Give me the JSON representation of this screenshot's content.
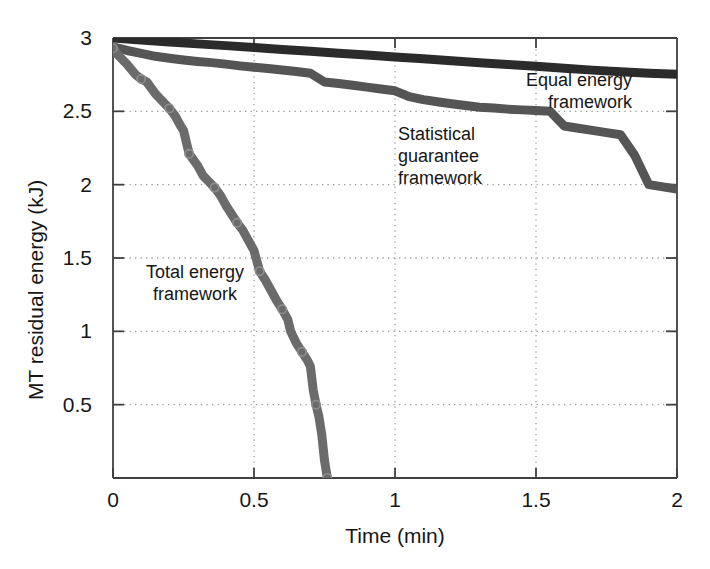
{
  "figure": {
    "background_color": "#ffffff",
    "axis_color": "#404040",
    "grid_color": "#9a9a9a"
  },
  "chart_data": {
    "type": "line",
    "title": "",
    "xlabel": "Time (min)",
    "ylabel": "MT residual energy (kJ)",
    "xlim": [
      0,
      2
    ],
    "ylim": [
      0,
      3
    ],
    "xticks": [
      0,
      0.5,
      1,
      1.5,
      2
    ],
    "xticklabels": [
      "0",
      "0.5",
      "1",
      "1.5",
      "2"
    ],
    "yticks": [
      0,
      0.5,
      1,
      1.5,
      2,
      2.5,
      3
    ],
    "yticklabels": [
      "",
      "0.5",
      "1",
      "1.5",
      "2",
      "2.5",
      "3"
    ],
    "grid": true,
    "grid_style": "dotted",
    "legend": "inline-annotations",
    "series": [
      {
        "name": "Equal energy framework",
        "label": "Equal energy\nframework",
        "color": "#2b2b2b",
        "line_width": 9,
        "markers": false,
        "x": [
          0,
          0.1,
          0.2,
          0.3,
          0.4,
          0.5,
          0.6,
          0.7,
          0.8,
          0.9,
          1.0,
          1.1,
          1.2,
          1.3,
          1.4,
          1.5,
          1.6,
          1.7,
          1.8,
          1.9,
          2.0
        ],
        "y": [
          3.0,
          2.986,
          2.973,
          2.96,
          2.948,
          2.935,
          2.922,
          2.909,
          2.896,
          2.884,
          2.871,
          2.858,
          2.845,
          2.832,
          2.82,
          2.807,
          2.794,
          2.781,
          2.77,
          2.76,
          2.752
        ]
      },
      {
        "name": "Statistical guarantee framework",
        "label": "Statistical\nguarantee\nframework",
        "color": "#555555",
        "line_width": 9,
        "markers": false,
        "x": [
          0,
          0.05,
          0.1,
          0.15,
          0.2,
          0.25,
          0.3,
          0.35,
          0.4,
          0.45,
          0.5,
          0.55,
          0.6,
          0.65,
          0.7,
          0.75,
          0.8,
          0.85,
          0.9,
          0.95,
          1.0,
          1.05,
          1.1,
          1.15,
          1.2,
          1.25,
          1.3,
          1.35,
          1.4,
          1.45,
          1.5,
          1.55,
          1.6,
          1.65,
          1.7,
          1.75,
          1.8,
          1.85,
          1.9,
          1.95,
          2.0
        ],
        "y": [
          2.94,
          2.915,
          2.895,
          2.875,
          2.862,
          2.85,
          2.84,
          2.832,
          2.822,
          2.81,
          2.8,
          2.792,
          2.782,
          2.772,
          2.76,
          2.7,
          2.69,
          2.678,
          2.665,
          2.652,
          2.64,
          2.6,
          2.58,
          2.565,
          2.552,
          2.54,
          2.528,
          2.522,
          2.515,
          2.51,
          2.505,
          2.5,
          2.4,
          2.385,
          2.37,
          2.355,
          2.34,
          2.2,
          2.0,
          1.985,
          1.97
        ]
      },
      {
        "name": "Total energy framework",
        "label": "Total energy\nframework",
        "color": "#6b6b6b",
        "line_width": 9,
        "markers": true,
        "marker": "o",
        "x": [
          0,
          0.02,
          0.05,
          0.08,
          0.1,
          0.12,
          0.15,
          0.17,
          0.2,
          0.22,
          0.24,
          0.25,
          0.27,
          0.3,
          0.32,
          0.34,
          0.36,
          0.38,
          0.4,
          0.42,
          0.44,
          0.46,
          0.48,
          0.5,
          0.52,
          0.54,
          0.56,
          0.58,
          0.6,
          0.62,
          0.63,
          0.65,
          0.67,
          0.69,
          0.7,
          0.71,
          0.72,
          0.73,
          0.74,
          0.75,
          0.76
        ],
        "y": [
          2.93,
          2.88,
          2.82,
          2.75,
          2.72,
          2.7,
          2.62,
          2.58,
          2.52,
          2.47,
          2.4,
          2.37,
          2.21,
          2.13,
          2.06,
          2.02,
          1.98,
          1.93,
          1.86,
          1.8,
          1.74,
          1.69,
          1.62,
          1.55,
          1.41,
          1.35,
          1.28,
          1.21,
          1.15,
          1.08,
          1.0,
          0.92,
          0.86,
          0.8,
          0.76,
          0.6,
          0.5,
          0.42,
          0.3,
          0.12,
          0.0
        ]
      }
    ]
  }
}
